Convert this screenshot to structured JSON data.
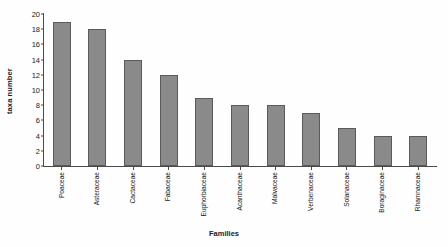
{
  "chart_data": {
    "type": "bar",
    "title": "",
    "xlabel": "Families",
    "ylabel": "taxa number",
    "categories": [
      "Poaceae",
      "Asteraceae",
      "Cactaceae",
      "Fabaceae",
      "Euphorbiaceae",
      "Acanthaceae",
      "Malvaceae",
      "Verbenaceae",
      "Solanaceae",
      "Boraginaceae",
      "Rhamnaceae"
    ],
    "values": [
      19,
      18,
      14,
      12,
      9,
      8,
      8,
      7,
      5,
      4,
      4
    ],
    "ylim": [
      0,
      20
    ],
    "yticks": [
      0,
      2,
      4,
      6,
      8,
      10,
      12,
      14,
      16,
      18,
      20
    ],
    "ytick_labels": [
      "0",
      "2",
      "4",
      "6",
      "8",
      "10",
      "12",
      "14",
      "16",
      "18",
      "20"
    ],
    "grid": false,
    "legend": false,
    "bar_color": "#8a8a8a",
    "bar_edge_color": "#5a5a5a",
    "axis_color": "#4a4a4a",
    "background_color": "#ffffff"
  }
}
